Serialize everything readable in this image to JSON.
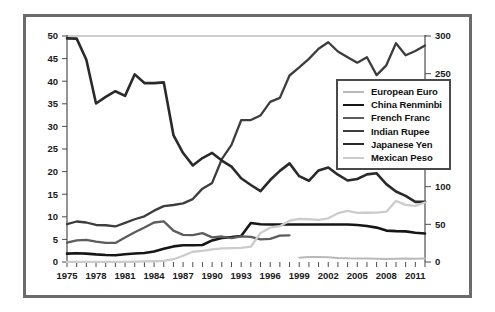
{
  "chart_data": {
    "type": "line",
    "title": "",
    "xlabel": "",
    "ylabel": "",
    "ylabel_right": "",
    "grid": false,
    "legend_position": "right-upper",
    "xlim": [
      1975,
      2012
    ],
    "ylim": [
      0,
      50
    ],
    "ylim_right": [
      0,
      300
    ],
    "x_tick_labels": [
      "1975",
      "1978",
      "1981",
      "1984",
      "1987",
      "1990",
      "1993",
      "1996",
      "1999",
      "2002",
      "2005",
      "2008",
      "2011"
    ],
    "x_tick_values": [
      1975,
      1978,
      1981,
      1984,
      1987,
      1990,
      1993,
      1996,
      1999,
      2002,
      2005,
      2008,
      2011
    ],
    "x_minor_ticks": [
      1975,
      1976,
      1977,
      1978,
      1979,
      1980,
      1981,
      1982,
      1983,
      1984,
      1985,
      1986,
      1987,
      1988,
      1989,
      1990,
      1991,
      1992,
      1993,
      1994,
      1995,
      1996,
      1997,
      1998,
      1999,
      2000,
      2001,
      2002,
      2003,
      2004,
      2005,
      2006,
      2007,
      2008,
      2009,
      2010,
      2011,
      2012
    ],
    "y_tick_labels_left": [
      "0",
      "5",
      "10",
      "15",
      "20",
      "25",
      "30",
      "35",
      "40",
      "45",
      "50"
    ],
    "y_tick_values_left": [
      0,
      5,
      10,
      15,
      20,
      25,
      30,
      35,
      40,
      45,
      50
    ],
    "y_tick_labels_right": [
      "0",
      "50",
      "100",
      "150",
      "200",
      "250",
      "300"
    ],
    "y_tick_values_right": [
      0,
      50,
      100,
      150,
      200,
      250,
      300
    ],
    "x": [
      1975,
      1976,
      1977,
      1978,
      1979,
      1980,
      1981,
      1982,
      1983,
      1984,
      1985,
      1986,
      1987,
      1988,
      1989,
      1990,
      1991,
      1992,
      1993,
      1994,
      1995,
      1996,
      1997,
      1998,
      1999,
      2000,
      2001,
      2002,
      2003,
      2004,
      2005,
      2006,
      2007,
      2008,
      2009,
      2010,
      2011,
      2012
    ],
    "series": [
      {
        "name": "European Euro",
        "color": "#b9b9b9",
        "width": 2.0,
        "axis": "left",
        "x": [
          1999,
          2000,
          2001,
          2002,
          2003,
          2004,
          2005,
          2006,
          2007,
          2008,
          2009,
          2010,
          2011,
          2012
        ],
        "values": [
          0.94,
          1.08,
          1.12,
          1.06,
          0.89,
          0.81,
          0.8,
          0.8,
          0.73,
          0.68,
          0.72,
          0.76,
          0.72,
          0.78
        ]
      },
      {
        "name": "China Renminbi",
        "color": "#161616",
        "width": 2.6,
        "axis": "left",
        "x": [
          1975,
          1976,
          1977,
          1978,
          1979,
          1980,
          1981,
          1982,
          1983,
          1984,
          1985,
          1986,
          1987,
          1988,
          1989,
          1990,
          1991,
          1992,
          1993,
          1994,
          1995,
          1996,
          1997,
          1998,
          1999,
          2000,
          2001,
          2002,
          2003,
          2004,
          2005,
          2006,
          2007,
          2008,
          2009,
          2010,
          2011,
          2012
        ],
        "values": [
          1.86,
          1.94,
          1.86,
          1.68,
          1.55,
          1.5,
          1.7,
          1.89,
          1.98,
          2.32,
          2.94,
          3.45,
          3.72,
          3.72,
          3.77,
          4.78,
          5.32,
          5.51,
          5.76,
          8.62,
          8.35,
          8.31,
          8.29,
          8.28,
          8.28,
          8.28,
          8.28,
          8.28,
          8.28,
          8.28,
          8.19,
          7.97,
          7.61,
          6.95,
          6.83,
          6.77,
          6.46,
          6.31
        ]
      },
      {
        "name": "French Franc",
        "color": "#5c5c5c",
        "width": 2.3,
        "axis": "left",
        "x": [
          1975,
          1976,
          1977,
          1978,
          1979,
          1980,
          1981,
          1982,
          1983,
          1984,
          1985,
          1986,
          1987,
          1988,
          1989,
          1990,
          1991,
          1992,
          1993,
          1994,
          1995,
          1996,
          1997,
          1998
        ],
        "values": [
          4.29,
          4.78,
          4.91,
          4.51,
          4.25,
          4.23,
          5.43,
          6.57,
          7.62,
          8.74,
          8.99,
          6.93,
          6.01,
          5.96,
          6.38,
          5.45,
          5.64,
          5.29,
          5.66,
          5.55,
          4.99,
          5.12,
          5.84,
          5.9
        ]
      },
      {
        "name": "Indian Rupee",
        "color": "#3d3d3d",
        "width": 2.3,
        "axis": "left",
        "x": [
          1975,
          1976,
          1977,
          1978,
          1979,
          1980,
          1981,
          1982,
          1983,
          1984,
          1985,
          1986,
          1987,
          1988,
          1989,
          1990,
          1991,
          1992,
          1993,
          1994,
          1995,
          1996,
          1997,
          1998,
          1999,
          2000,
          2001,
          2002,
          2003,
          2004,
          2005,
          2006,
          2007,
          2008,
          2009,
          2010,
          2011,
          2012
        ],
        "values": [
          8.38,
          8.96,
          8.74,
          8.19,
          8.13,
          7.86,
          8.66,
          9.46,
          10.1,
          11.36,
          12.37,
          12.61,
          12.96,
          13.92,
          16.23,
          17.5,
          22.74,
          25.92,
          31.37,
          31.4,
          32.43,
          35.43,
          36.31,
          41.26,
          43.06,
          44.94,
          47.19,
          48.61,
          46.58,
          45.32,
          44.1,
          45.31,
          41.35,
          43.51,
          48.41,
          45.73,
          46.67,
          47.92
        ]
      },
      {
        "name": "Japanese Yen",
        "color": "#2a2a2a",
        "width": 2.6,
        "axis": "right",
        "x": [
          1975,
          1976,
          1977,
          1978,
          1979,
          1980,
          1981,
          1982,
          1983,
          1984,
          1985,
          1986,
          1987,
          1988,
          1989,
          1990,
          1991,
          1992,
          1993,
          1994,
          1995,
          1996,
          1997,
          1998,
          1999,
          2000,
          2001,
          2002,
          2003,
          2004,
          2005,
          2006,
          2007,
          2008,
          2009,
          2010,
          2011,
          2012
        ],
        "values": [
          296.8,
          296.5,
          268.5,
          210.4,
          219.1,
          226.7,
          220.5,
          249.1,
          237.5,
          237.5,
          238.5,
          168.5,
          144.6,
          128.2,
          138.0,
          144.8,
          134.7,
          126.7,
          111.2,
          102.2,
          94.1,
          108.8,
          121.0,
          130.9,
          113.9,
          107.8,
          121.5,
          125.4,
          115.9,
          108.2,
          110.2,
          116.3,
          117.8,
          103.4,
          93.6,
          87.8,
          79.8,
          79.8
        ]
      },
      {
        "name": "Mexican Peso",
        "color": "#cccccc",
        "width": 2.3,
        "axis": "left",
        "x": [
          1975,
          1976,
          1977,
          1978,
          1979,
          1980,
          1981,
          1982,
          1983,
          1984,
          1985,
          1986,
          1987,
          1988,
          1989,
          1990,
          1991,
          1992,
          1993,
          1994,
          1995,
          1996,
          1997,
          1998,
          1999,
          2000,
          2001,
          2002,
          2003,
          2004,
          2005,
          2006,
          2007,
          2008,
          2009,
          2010,
          2011,
          2012
        ],
        "values": [
          0.01,
          0.02,
          0.02,
          0.02,
          0.02,
          0.02,
          0.02,
          0.06,
          0.12,
          0.17,
          0.26,
          0.61,
          1.38,
          2.27,
          2.46,
          2.81,
          3.02,
          3.09,
          3.12,
          3.38,
          6.42,
          7.6,
          7.92,
          9.14,
          9.56,
          9.46,
          9.34,
          9.66,
          10.79,
          11.29,
          10.89,
          10.9,
          10.93,
          11.13,
          13.5,
          12.64,
          12.42,
          13.17
        ]
      }
    ]
  },
  "legend": {
    "entries": [
      {
        "label": "European Euro"
      },
      {
        "label": "China Renminbi"
      },
      {
        "label": "French Franc"
      },
      {
        "label": "Indian Rupee"
      },
      {
        "label": "Japanese Yen"
      },
      {
        "label": "Mexican Peso"
      }
    ]
  }
}
